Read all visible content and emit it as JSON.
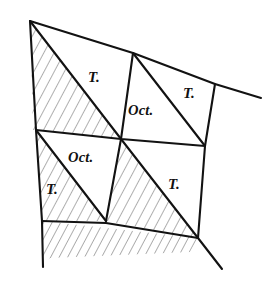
{
  "figure": {
    "kind": "crystal-form-diagram",
    "background_color": "#ffffff",
    "line_color": "#121212",
    "hatch_color": "#2b2b2b",
    "labels": [
      {
        "id": "t-upper-left",
        "text": "T.",
        "x": 88,
        "y": 82,
        "style": "normal"
      },
      {
        "id": "t-upper-right",
        "text": "T.",
        "x": 183,
        "y": 98,
        "style": "normal"
      },
      {
        "id": "oct-upper",
        "text": "Oct.",
        "x": 128,
        "y": 115,
        "style": "normal"
      },
      {
        "id": "oct-lower",
        "text": "Oct.",
        "x": 68,
        "y": 162,
        "style": "normal"
      },
      {
        "id": "t-lower-left",
        "text": "T.",
        "x": 46,
        "y": 194,
        "style": "normal"
      },
      {
        "id": "t-lower-right",
        "text": "T.",
        "x": 168,
        "y": 189,
        "style": "normal"
      }
    ],
    "vertices": {
      "apex_top_left": [
        30,
        21
      ],
      "top_mid": [
        133,
        53
      ],
      "top_right_corner": [
        215,
        84
      ],
      "top_edge_end": [
        261,
        98
      ],
      "left_mid": [
        36,
        130
      ],
      "center": [
        121,
        139
      ],
      "right_mid": [
        205,
        146
      ],
      "left_low": [
        42,
        221
      ],
      "bottom_mid": [
        106,
        221
      ],
      "bottom_right": [
        198,
        238
      ],
      "left_bottom_end": [
        43,
        267
      ],
      "bottom_edge_end": [
        222,
        269
      ]
    },
    "edges": [
      {
        "id": "top-edge",
        "from": "apex_top_left",
        "to": "top_edge_end"
      },
      {
        "id": "left-edge",
        "from": "apex_top_left",
        "to": "left_bottom_end"
      },
      {
        "id": "upper-diagonal",
        "from": "apex_top_left",
        "to": "center"
      },
      {
        "id": "upper-mid-vertical",
        "from": "top_mid",
        "to": "center"
      },
      {
        "id": "upper-right-diagonal",
        "from": "top_mid",
        "to": "right_mid"
      },
      {
        "id": "right-vertical",
        "from": "top_right_corner",
        "to": "bottom_right"
      },
      {
        "id": "mid-horizontal-right",
        "from": "center",
        "to": "right_mid"
      },
      {
        "id": "mid-horizontal-left",
        "from": "left_mid",
        "to": "center"
      },
      {
        "id": "lower-diagonal-left",
        "from": "left_mid",
        "to": "bottom_mid"
      },
      {
        "id": "lower-mid-vertical",
        "from": "center",
        "to": "bottom_mid"
      },
      {
        "id": "lower-diagonal-right",
        "from": "center",
        "to": "bottom_right"
      },
      {
        "id": "bottom-edge",
        "from": "left_low",
        "to": "bottom_edge_end"
      }
    ],
    "hatched_regions": [
      {
        "id": "hatch-upper-left",
        "note": "triangle apex-left edge-center"
      },
      {
        "id": "hatch-lower-left",
        "note": "triangle left_mid-left_low-bottom_mid"
      },
      {
        "id": "hatch-lower-band",
        "note": "band below bottom edge line"
      },
      {
        "id": "hatch-lower-middle",
        "note": "quad center-bottom_mid-bottom_right"
      }
    ]
  }
}
